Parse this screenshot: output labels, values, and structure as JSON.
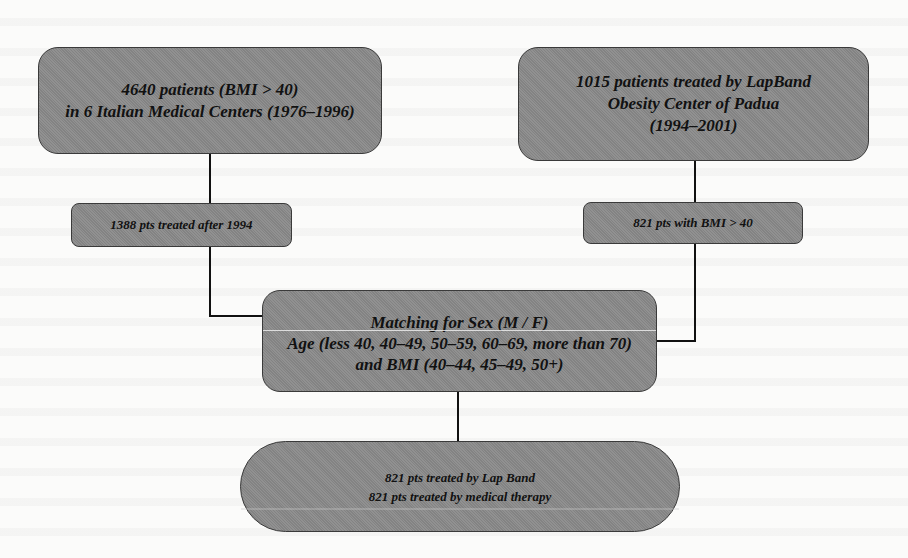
{
  "diagram": {
    "type": "flowchart",
    "nodes": {
      "source_italian_centers": {
        "lines": [
          "4640 patients (BMI > 40)",
          "in 6 Italian Medical Centers (1976–1996)"
        ]
      },
      "source_padua": {
        "lines": [
          "1015 patients treated by LapBand",
          "Obesity Center of Padua",
          "(1994–2001)"
        ]
      },
      "filter_after_1994": {
        "lines": [
          "1388 pts treated after 1994"
        ]
      },
      "filter_bmi_40": {
        "lines": [
          "821 pts with BMI > 40"
        ]
      },
      "matching": {
        "lines": [
          "Matching for Sex (M / F)",
          "Age (less 40, 40–49, 50–59, 60–69, more than 70)",
          "and BMI (40–44, 45–49, 50+)"
        ]
      },
      "result": {
        "lines": [
          "821 pts treated by Lap Band",
          "821 pts treated by medical therapy"
        ]
      }
    },
    "edges": [
      {
        "from": "source_italian_centers",
        "to": "filter_after_1994"
      },
      {
        "from": "filter_after_1994",
        "to": "matching"
      },
      {
        "from": "source_padua",
        "to": "filter_bmi_40"
      },
      {
        "from": "filter_bmi_40",
        "to": "matching"
      },
      {
        "from": "matching",
        "to": "result"
      }
    ],
    "colors": {
      "box_fill": "#8a8a8a",
      "box_border": "#3a3a3a",
      "connector": "#111111",
      "text": "#111111",
      "background": "#fbfbfa"
    }
  }
}
